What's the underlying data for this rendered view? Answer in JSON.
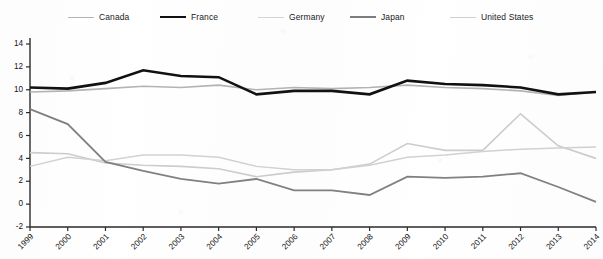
{
  "chart_data": {
    "type": "line",
    "title": "",
    "xlabel": "",
    "ylabel": "",
    "grid": false,
    "legend_position": "top",
    "x": [
      1999,
      2000,
      2001,
      2002,
      2003,
      2004,
      2005,
      2006,
      2007,
      2008,
      2009,
      2010,
      2011,
      2012,
      2013,
      2014
    ],
    "xtick_labels": [
      "1999",
      "2000",
      "2001",
      "2002",
      "2003",
      "2004",
      "2005",
      "2006",
      "2007",
      "2008",
      "2009",
      "2010",
      "2011",
      "2012",
      "2013",
      "2014"
    ],
    "ytick_labels": [
      "-2",
      "0",
      "2",
      "4",
      "6",
      "8",
      "10",
      "12",
      "14"
    ],
    "yticks": [
      -2,
      0,
      2,
      4,
      6,
      8,
      10,
      12,
      14
    ],
    "ylim": [
      -2,
      14
    ],
    "xlim": [
      1999,
      2014
    ],
    "series": [
      {
        "name": "Canada",
        "color": "#b4b4b4",
        "width": 1.6,
        "values": [
          9.8,
          9.9,
          10.1,
          10.3,
          10.2,
          10.4,
          10.0,
          10.2,
          10.1,
          10.2,
          10.4,
          10.2,
          10.1,
          9.9,
          9.5,
          9.8
        ]
      },
      {
        "name": "France",
        "color": "#111111",
        "width": 2.6,
        "values": [
          10.2,
          10.1,
          10.6,
          11.7,
          11.2,
          11.1,
          9.6,
          9.9,
          9.9,
          9.6,
          10.8,
          10.5,
          10.4,
          10.2,
          9.6,
          9.8
        ]
      },
      {
        "name": "Germany",
        "color": "#d2d2d2",
        "width": 1.5,
        "values": [
          3.3,
          4.1,
          3.8,
          4.3,
          4.3,
          4.1,
          3.3,
          3.0,
          3.0,
          3.4,
          4.1,
          4.3,
          4.6,
          4.8,
          4.9,
          5.0
        ]
      },
      {
        "name": "Japan",
        "color": "#808080",
        "width": 1.8,
        "values": [
          8.3,
          7.0,
          3.7,
          2.9,
          2.2,
          1.8,
          2.2,
          1.2,
          1.2,
          0.8,
          2.4,
          2.3,
          2.4,
          2.7,
          1.5,
          0.2
        ]
      },
      {
        "name": "United States",
        "color": "#cdcdcd",
        "width": 1.6,
        "values": [
          4.5,
          4.4,
          3.6,
          3.4,
          3.3,
          3.1,
          2.4,
          2.8,
          3.0,
          3.5,
          5.3,
          4.7,
          4.7,
          7.9,
          5.1,
          4.0
        ]
      }
    ]
  },
  "legend": {
    "entries": [
      {
        "label": "Canada",
        "color": "#b4b4b4",
        "width": 1.8
      },
      {
        "label": "France",
        "color": "#111111",
        "width": 2.8
      },
      {
        "label": "Germany",
        "color": "#d6d6d6",
        "width": 1.5
      },
      {
        "label": "Japan",
        "color": "#7d7d7d",
        "width": 2.0
      },
      {
        "label": "United States",
        "color": "#d0d0d0",
        "width": 1.5
      }
    ]
  }
}
